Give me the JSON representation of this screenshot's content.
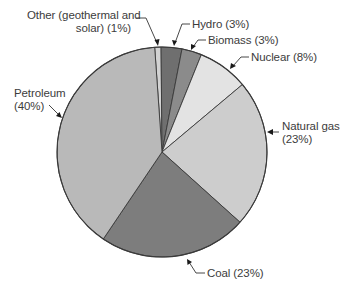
{
  "chart_data": {
    "type": "pie",
    "title": "",
    "categories": [
      "Other (geothermal and solar)",
      "Hydro",
      "Biomass",
      "Nuclear",
      "Natural gas",
      "Coal",
      "Petroleum"
    ],
    "values": [
      1,
      3,
      3,
      8,
      23,
      23,
      40
    ],
    "unit": "%",
    "legend": "none (direct labels with leader arrows)",
    "start_angle_deg": -4,
    "direction": "clockwise",
    "slices": [
      {
        "name": "Other (geothermal and solar)",
        "value": 1,
        "color": "#d2d2d2",
        "start": -4,
        "end": -0.5
      },
      {
        "name": "Hydro",
        "value": 3,
        "color": "#6f6f6f",
        "start": -0.5,
        "end": 11
      },
      {
        "name": "Biomass",
        "value": 3,
        "color": "#8b8b8b",
        "start": 11,
        "end": 22
      },
      {
        "name": "Nuclear",
        "value": 8,
        "color": "#e3e3e3",
        "start": 22,
        "end": 50
      },
      {
        "name": "Natural gas",
        "value": 23,
        "color": "#cdcdcd",
        "start": 50,
        "end": 132
      },
      {
        "name": "Coal",
        "value": 23,
        "color": "#7d7d7d",
        "start": 132,
        "end": 214
      },
      {
        "name": "Petroleum",
        "value": 40,
        "color": "#b9b9b9",
        "start": 214,
        "end": 356
      }
    ]
  },
  "labels": {
    "other_line1": "Other (geothermal and",
    "other_line2": "solar) (1%)",
    "hydro": "Hydro (3%)",
    "biomass": "Biomass (3%)",
    "nuclear": "Nuclear (8%)",
    "natural_gas_line1": "Natural gas",
    "natural_gas_line2": "(23%)",
    "coal": "Coal (23%)",
    "petroleum_line1": "Petroleum",
    "petroleum_line2": "(40%)"
  }
}
